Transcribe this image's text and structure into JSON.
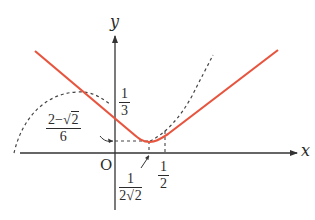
{
  "diagram": {
    "axes": {
      "x_label": "x",
      "y_label": "y",
      "origin_label": "O"
    },
    "labels": {
      "y_intercept": {
        "numerator": "1",
        "denominator": "3"
      },
      "min_value": {
        "numerator_prefix": "2−",
        "numerator_radicand": "2",
        "denominator": "6"
      },
      "min_x": {
        "numerator": "1",
        "denominator_prefix": "2",
        "denominator_radicand": "2"
      },
      "half": {
        "numerator": "1",
        "denominator": "2"
      }
    },
    "colors": {
      "curve": "#e8553f",
      "axis": "#333333",
      "dashed": "#444444",
      "text": "#2b2b2b"
    },
    "curves": [
      {
        "name": "main-curve",
        "style": "solid red",
        "description": "V-shaped curve with rounded minimum"
      },
      {
        "name": "left-dashed-curve",
        "style": "dashed",
        "description": "auxiliary curve tangent to left branch"
      },
      {
        "name": "right-dashed-curve",
        "style": "dashed",
        "description": "auxiliary curve tangent to right branch"
      }
    ]
  }
}
